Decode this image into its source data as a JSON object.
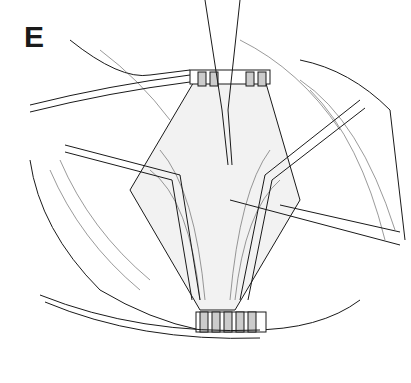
{
  "figure": {
    "panel_label": "E",
    "colors": {
      "ink": "#1a1a1a",
      "background": "#ffffff"
    }
  }
}
